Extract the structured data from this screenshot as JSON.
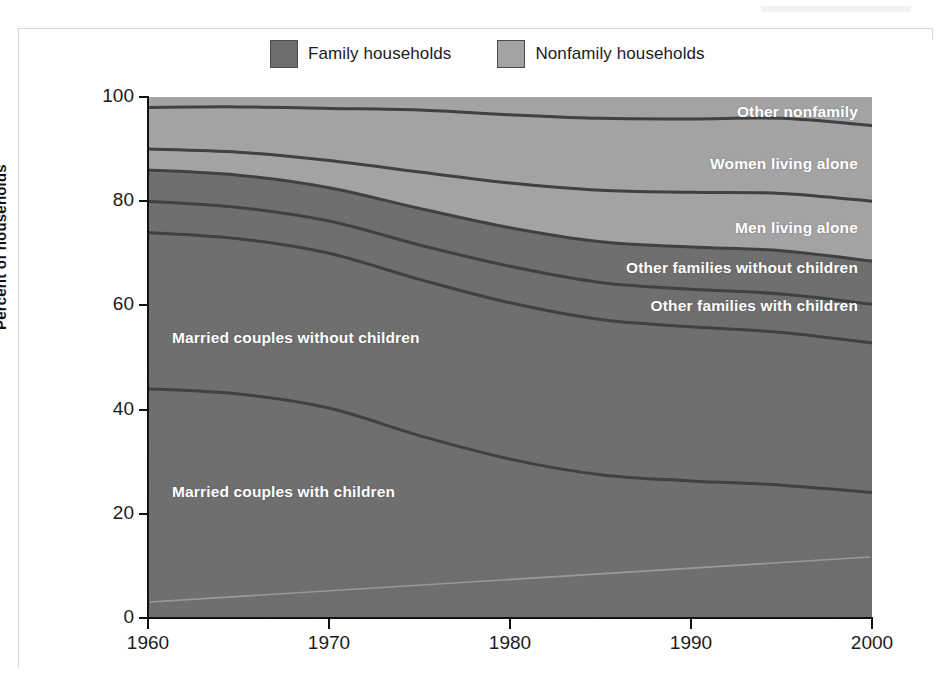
{
  "figure": {
    "background": "#ffffff",
    "plot_note": "Scanned stacked-area figure: U.S. household composition, 1960-2000"
  },
  "legend": {
    "position": "top-center",
    "items": [
      {
        "label": "Family households",
        "color": "#6e6e6e",
        "swatch_name": "family-households-swatch"
      },
      {
        "label": "Nonfamily households",
        "color": "#a3a3a3",
        "swatch_name": "nonfamily-households-swatch"
      }
    ]
  },
  "axes": {
    "y_title": "Percent of households",
    "y_ticks": [
      "0",
      "20",
      "40",
      "60",
      "80",
      "100"
    ],
    "x_ticks": [
      "1960",
      "1970",
      "1980",
      "1990",
      "2000"
    ]
  },
  "series_labels": [
    {
      "text": "Other nonfamily",
      "name": "label-other-nonfamily",
      "x": 858,
      "y": 103,
      "align": "right"
    },
    {
      "text": "Women living alone",
      "name": "label-women-living-alone",
      "x": 858,
      "y": 155,
      "align": "right"
    },
    {
      "text": "Men living alone",
      "name": "label-men-living-alone",
      "x": 858,
      "y": 219,
      "align": "right"
    },
    {
      "text": "Other families without children",
      "name": "label-other-families-without-children",
      "x": 858,
      "y": 259,
      "align": "right"
    },
    {
      "text": "Other families with children",
      "name": "label-other-families-with-children",
      "x": 858,
      "y": 297,
      "align": "right"
    },
    {
      "text": "Married couples without children",
      "name": "label-married-couples-without-children",
      "x": 172,
      "y": 329,
      "align": "left"
    },
    {
      "text": "Married couples with children",
      "name": "label-married-couples-with-children",
      "x": 172,
      "y": 483,
      "align": "left"
    }
  ],
  "chart_data": {
    "type": "area",
    "stacked": true,
    "title": "",
    "subtitle": "",
    "xlabel": "",
    "ylabel": "Percent of households",
    "xlim": [
      1960,
      2000
    ],
    "ylim": [
      0,
      100
    ],
    "grid": false,
    "legend_position": "top-center",
    "x": [
      1960,
      1965,
      1970,
      1975,
      1980,
      1985,
      1990,
      1995,
      2000
    ],
    "xtick_labels": [
      "1960",
      "1970",
      "1980",
      "1990",
      "2000"
    ],
    "ytick_labels": [
      "0",
      "20",
      "40",
      "60",
      "80",
      "100"
    ],
    "group_colors": {
      "family": "#6e6e6e",
      "nonfamily": "#a3a3a3"
    },
    "boundary_line_color": "#3f3f3f",
    "series": [
      {
        "name": "Married couples with children",
        "group": "family",
        "color": "#6e6e6e",
        "values": [
          44.0,
          43.0,
          40.3,
          35.0,
          30.5,
          27.5,
          26.3,
          25.5,
          24.1
        ],
        "cumulative_top": [
          44.0,
          43.0,
          40.3,
          35.0,
          30.5,
          27.5,
          26.3,
          25.5,
          24.1
        ]
      },
      {
        "name": "Married couples without children",
        "group": "family",
        "color": "#6e6e6e",
        "values": [
          30.0,
          29.8,
          29.7,
          30.0,
          30.0,
          29.8,
          29.6,
          29.3,
          28.7
        ],
        "cumulative_top": [
          74.0,
          72.8,
          70.0,
          65.0,
          60.5,
          57.3,
          55.9,
          54.8,
          52.8
        ]
      },
      {
        "name": "Other families with children",
        "group": "family",
        "color": "#6e6e6e",
        "values": [
          6.0,
          6.0,
          6.2,
          6.6,
          7.0,
          7.1,
          7.2,
          7.4,
          7.4
        ],
        "cumulative_top": [
          80.0,
          78.8,
          76.2,
          71.6,
          67.5,
          64.4,
          63.1,
          62.2,
          60.2
        ]
      },
      {
        "name": "Other families without children",
        "group": "family",
        "color": "#6e6e6e",
        "values": [
          6.0,
          6.2,
          6.4,
          7.0,
          7.4,
          7.8,
          8.1,
          8.3,
          8.3
        ],
        "cumulative_top": [
          86.0,
          85.0,
          82.6,
          78.6,
          74.9,
          72.2,
          71.2,
          70.5,
          68.5
        ]
      },
      {
        "name": "Men living alone",
        "group": "nonfamily",
        "color": "#a3a3a3",
        "values": [
          4.0,
          4.4,
          5.2,
          7.0,
          8.6,
          9.9,
          10.5,
          11.0,
          11.5
        ],
        "cumulative_top": [
          90.0,
          89.4,
          87.8,
          85.6,
          83.5,
          82.1,
          81.7,
          81.5,
          80.0
        ]
      },
      {
        "name": "Women living alone",
        "group": "nonfamily",
        "color": "#a3a3a3",
        "values": [
          8.0,
          8.7,
          10.0,
          11.9,
          13.1,
          13.8,
          14.1,
          14.4,
          14.5
        ],
        "cumulative_top": [
          98.0,
          98.1,
          97.8,
          97.5,
          96.6,
          95.9,
          95.8,
          95.9,
          94.5
        ]
      },
      {
        "name": "Other nonfamily",
        "group": "nonfamily",
        "color": "#a3a3a3",
        "values": [
          2.0,
          1.9,
          2.2,
          2.5,
          3.4,
          4.1,
          4.2,
          4.1,
          5.5
        ],
        "cumulative_top": [
          100,
          100,
          100,
          100,
          100,
          100,
          100,
          100,
          100
        ]
      }
    ]
  }
}
